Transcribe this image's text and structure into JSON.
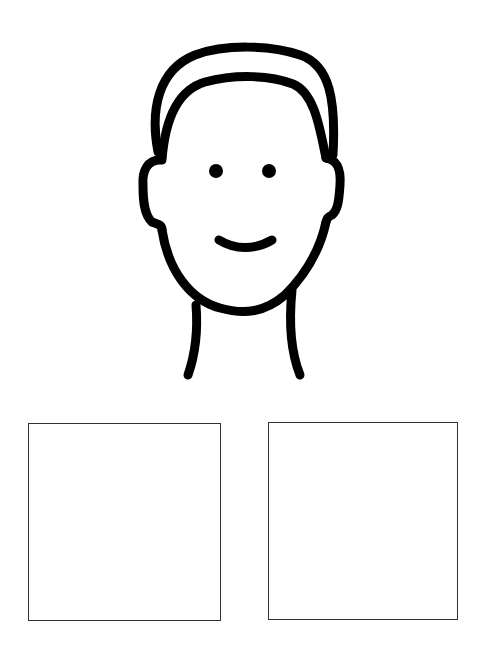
{
  "illustration": {
    "subject": "face-outline",
    "stroke_color": "#000000",
    "background": "#ffffff"
  },
  "boxes": [
    {
      "name": "left-answer-box",
      "border_color": "#333333"
    },
    {
      "name": "right-answer-box",
      "border_color": "#333333"
    }
  ]
}
